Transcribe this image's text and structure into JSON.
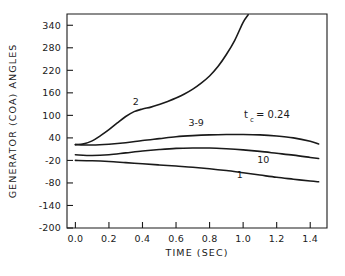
{
  "chart_data": {
    "type": "line",
    "title": "",
    "xlabel": "TIME (SEC)",
    "ylabel": "GENERATOR (COA) ANGLES",
    "xlim": [
      -0.05,
      1.5
    ],
    "ylim": [
      -200,
      370
    ],
    "xticks": [
      0.0,
      0.2,
      0.4,
      0.6,
      0.8,
      1.0,
      1.2,
      1.4
    ],
    "xtick_labels": [
      "0.0",
      "0.2",
      "0.4",
      "0.6",
      "0.8",
      "1.0",
      "1.2",
      "1.4"
    ],
    "yticks": [
      340,
      280,
      220,
      160,
      100,
      40,
      -20,
      -80,
      -140,
      -200
    ],
    "ytick_labels": [
      "340",
      "280",
      "220",
      "160",
      "100",
      "40",
      "-20",
      "-80",
      "-140",
      "-200"
    ],
    "grid": false,
    "legend": "inline-curve-labels",
    "annotations": [
      {
        "name": "clearing-time",
        "text_main_1": "t",
        "text_sub": "c",
        "text_main_2": "= 0.24",
        "full_text": "t_c = 0.24",
        "x": 0.95,
        "y": 118
      }
    ],
    "series": [
      {
        "name": "2",
        "label": "2",
        "label_x": 0.36,
        "label_y": 128,
        "x": [
          0.0,
          0.05,
          0.1,
          0.15,
          0.2,
          0.25,
          0.3,
          0.35,
          0.4,
          0.45,
          0.5,
          0.55,
          0.6,
          0.65,
          0.7,
          0.75,
          0.8,
          0.85,
          0.9,
          0.95,
          1.0,
          1.03
        ],
        "y": [
          22,
          24,
          32,
          46,
          62,
          80,
          97,
          110,
          117,
          122,
          129,
          137,
          146,
          157,
          170,
          186,
          205,
          230,
          262,
          300,
          348,
          368
        ]
      },
      {
        "name": "3-9",
        "label": "3-9",
        "label_x": 0.72,
        "label_y": 72,
        "x": [
          0.0,
          0.1,
          0.2,
          0.3,
          0.4,
          0.5,
          0.6,
          0.7,
          0.8,
          0.9,
          1.0,
          1.1,
          1.2,
          1.3,
          1.4,
          1.45
        ],
        "y": [
          22,
          21,
          23,
          27,
          33,
          38,
          43,
          46,
          48,
          49,
          49,
          48,
          45,
          40,
          31,
          24
        ]
      },
      {
        "name": "10",
        "label": "10",
        "label_x": 1.12,
        "label_y": -28,
        "x": [
          0.0,
          0.1,
          0.2,
          0.3,
          0.4,
          0.5,
          0.6,
          0.7,
          0.8,
          0.9,
          1.0,
          1.1,
          1.2,
          1.3,
          1.4,
          1.45
        ],
        "y": [
          -5,
          -7,
          -5,
          0,
          5,
          9,
          12,
          13,
          13,
          11,
          8,
          4,
          -1,
          -6,
          -12,
          -15
        ]
      },
      {
        "name": "1",
        "label": "1",
        "label_x": 0.98,
        "label_y": -66,
        "x": [
          0.0,
          0.1,
          0.2,
          0.3,
          0.4,
          0.5,
          0.6,
          0.7,
          0.8,
          0.9,
          1.0,
          1.1,
          1.2,
          1.3,
          1.4,
          1.45
        ],
        "y": [
          -20,
          -21,
          -23,
          -26,
          -29,
          -32,
          -35,
          -38,
          -42,
          -47,
          -53,
          -59,
          -65,
          -70,
          -75,
          -77
        ]
      }
    ]
  }
}
